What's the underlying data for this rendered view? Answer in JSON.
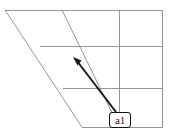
{
  "figure": {
    "title": "",
    "background_color": "#ffffff",
    "width": 171,
    "height": 138
  },
  "grid": {
    "stroke_color": "#8a8a8a",
    "stroke_width": 0.9,
    "description": "sheared perspective grid",
    "horizontal_lines": [
      {
        "name": "top-edge",
        "x1": 5,
        "y1": 10,
        "x2": 163,
        "y2": 10
      },
      {
        "name": "middle-line-upper",
        "x1": 40,
        "y1": 46,
        "x2": 163,
        "y2": 46
      },
      {
        "name": "middle-line-lower",
        "x1": 63,
        "y1": 88,
        "x2": 163,
        "y2": 88
      },
      {
        "name": "bottom-edge",
        "x1": 82,
        "y1": 127,
        "x2": 163,
        "y2": 127
      }
    ],
    "slanted_lines": [
      {
        "name": "left-edge-slant",
        "x1": 5,
        "y1": 10,
        "x2": 82,
        "y2": 127
      },
      {
        "name": "inner-slant",
        "x1": 62,
        "y1": 10,
        "x2": 119,
        "y2": 127
      }
    ],
    "vertical_lines": [
      {
        "name": "inner-vertical",
        "x1": 119,
        "y1": 10,
        "x2": 119,
        "y2": 127
      },
      {
        "name": "right-edge",
        "x1": 163,
        "y1": 10,
        "x2": 163,
        "y2": 127
      }
    ]
  },
  "arrow": {
    "color": "#1a1a1a",
    "stroke_width": 2.0,
    "tail_x": 116,
    "tail_y": 112,
    "head_x": 73,
    "head_y": 57,
    "head_style": "solid-triangle",
    "label": "a1"
  },
  "callout": {
    "label_text": "a1",
    "border_color": "#111111",
    "background_color": "#ffffff"
  }
}
